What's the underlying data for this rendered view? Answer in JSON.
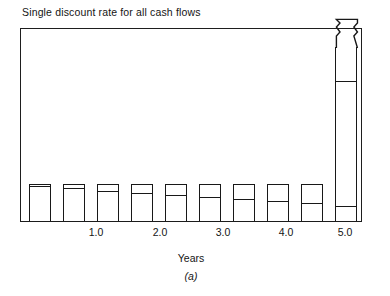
{
  "chart_data": {
    "type": "bar",
    "title": "Single discount rate for all cash flows",
    "xlabel": "Years",
    "ylabel": "",
    "caption": "(a)",
    "grid": false,
    "legend": null,
    "xlim": [
      0.0,
      5.5
    ],
    "ylim": [
      0,
      100
    ],
    "xticks": [
      1.0,
      2.0,
      3.0,
      4.0,
      5.0
    ],
    "xtick_labels": [
      "1.0",
      "2.0",
      "3.0",
      "4.0",
      "5.0"
    ],
    "bar_style": "unfilled-outline",
    "note": "Each bar is split by an internal horizontal line; the lower segment is the discounted present value and the full bar is the nominal cash flow. The final bar is truncated by a zigzag axis break.",
    "x": [
      0.5,
      1.0,
      1.5,
      2.0,
      2.5,
      3.0,
      3.5,
      4.0,
      4.5,
      5.0
    ],
    "series": [
      {
        "name": "Nominal cash flow",
        "values": [
          19.5,
          19.5,
          19.5,
          19.5,
          19.5,
          19.5,
          19.5,
          19.5,
          19.5,
          100.0
        ]
      },
      {
        "name": "Discounted present value",
        "values": [
          18.0,
          17.0,
          15.5,
          14.5,
          13.5,
          12.5,
          11.5,
          10.5,
          9.5,
          8.0
        ]
      }
    ],
    "broken_bar_index": 9,
    "break_symbol": "zigzag"
  },
  "axis": {
    "tick_0": "1.0",
    "tick_1": "2.0",
    "tick_2": "3.0",
    "tick_3": "4.0",
    "tick_4": "5.0"
  }
}
